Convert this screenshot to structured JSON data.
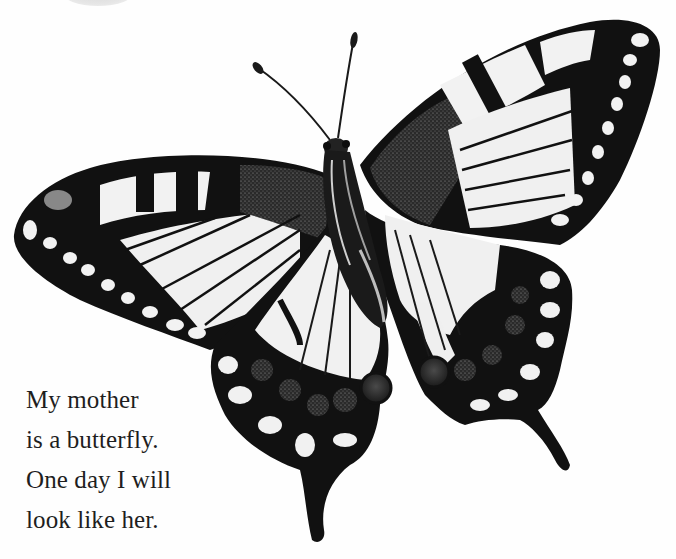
{
  "page": {
    "background": "#ffffff",
    "illustration": {
      "subject": "swallowtail butterfly",
      "style": "black and white",
      "colors": {
        "wing_black": "#111111",
        "wing_pale": "#f1f1f1",
        "wing_grey": "#5a5a5a",
        "eyespot": "#3a3a3a"
      }
    },
    "caption": {
      "lines": [
        "My mother",
        "is a butterfly.",
        "One day I will",
        "look like her."
      ],
      "color": "#1e1e1e"
    }
  }
}
